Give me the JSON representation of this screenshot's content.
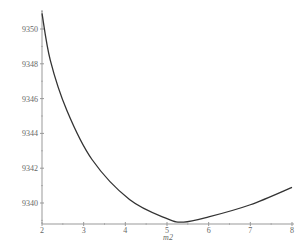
{
  "chart_data": {
    "type": "line",
    "title": "",
    "xlabel": "m2",
    "ylabel": "",
    "xlim": [
      2,
      8
    ],
    "ylim": [
      9338.8,
      9350.9
    ],
    "x_ticks": [
      "2",
      "3",
      "4",
      "5",
      "6",
      "7",
      "8"
    ],
    "y_ticks": [
      "9340",
      "9342",
      "9344",
      "9346",
      "9348",
      "9350"
    ],
    "grid": false,
    "legend": null,
    "series": [
      {
        "name": "curve",
        "x": [
          2.0,
          2.2,
          2.6,
          3.2,
          4.1,
          5.0,
          5.4,
          6.0,
          7.0,
          8.0
        ],
        "y": [
          9350.9,
          9348.2,
          9345.3,
          9342.5,
          9340.2,
          9339.1,
          9338.9,
          9339.2,
          9339.9,
          9340.9
        ]
      }
    ],
    "colors": {
      "line": "#333333",
      "axis": "#999999",
      "text": "#666666"
    }
  }
}
